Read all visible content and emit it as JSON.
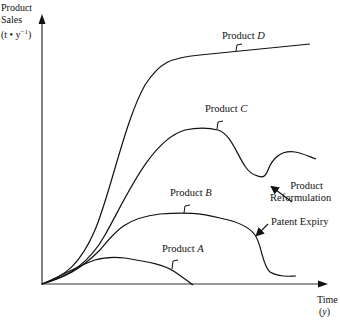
{
  "y_axis": {
    "line1": "Product",
    "line2": "Sales",
    "line3_prefix": "(t • y",
    "line3_sup": "−1",
    "line3_suffix": ")"
  },
  "x_axis": {
    "line1": "Time",
    "line2": "(y)"
  },
  "curves": {
    "a": {
      "prefix": "Product",
      "letter": "A"
    },
    "b": {
      "prefix": "Product",
      "letter": "B"
    },
    "c": {
      "prefix": "Product",
      "letter": "C"
    },
    "d": {
      "prefix": "Product",
      "letter": "D"
    }
  },
  "annotations": {
    "reformulation_line1": "Product",
    "reformulation_line2": "Reformulation",
    "patent_expiry": "Patent Expiry"
  },
  "colors": {
    "line": "#111111",
    "background": "#ffffff"
  }
}
